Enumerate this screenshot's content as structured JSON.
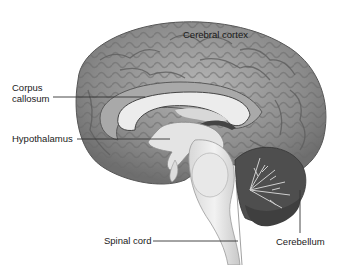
{
  "diagram": {
    "labels": {
      "cerebral_cortex": "Cerebral cortex",
      "corpus_callosum_line1": "Corpus",
      "corpus_callosum_line2": "callosum",
      "hypothalamus": "Hypothalamus",
      "spinal_cord": "Spinal cord",
      "cerebellum": "Cerebellum"
    },
    "colors": {
      "cortex": "#8c8c8c",
      "cortex_highlight": "#c8c8c8",
      "white_matter": "#e6e6e6",
      "cerebellum": "#5a5a5a",
      "leader_line": "#333333",
      "text": "#1a1a1a"
    }
  }
}
